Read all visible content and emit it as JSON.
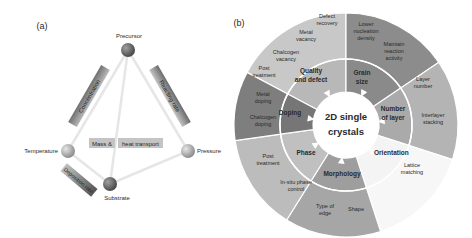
{
  "panel_a": {
    "label": "(a)",
    "nodes": {
      "precursor": "Precursor",
      "temperature": "Temperature",
      "pressure": "Pressure",
      "substrate": "Substrate"
    },
    "bars": {
      "concentration": "Concentration",
      "reacting_rate": "Reacting rate",
      "deposition_rate": "Deposition rate"
    },
    "center_labels": {
      "mass": "Mass &",
      "heat": "heat transport"
    }
  },
  "panel_b": {
    "label": "(b)",
    "center": {
      "line1": "2D single",
      "line2": "crystals"
    },
    "inner": {
      "quality": [
        "Quality",
        "and defect"
      ],
      "grain": [
        "Grain",
        "size"
      ],
      "layer": [
        "Number",
        "of layer"
      ],
      "orientation": "Orientation",
      "morphology": "Morphology",
      "phase": "Phase",
      "doping": "Doping"
    },
    "outer": {
      "defect_recovery": [
        "Defect",
        "recovery"
      ],
      "metal_vacancy": [
        "Metal",
        "vacancy"
      ],
      "chalcogen_vacancy": [
        "Chalcogen",
        "vacancy"
      ],
      "lower_nucleation": [
        "Lower",
        "nucleation",
        "density"
      ],
      "maintain_reaction": [
        "Maintain",
        "reaction",
        "activity"
      ],
      "layer_number": [
        "Layer",
        "number"
      ],
      "interlayer_stacking": [
        "Interlayer",
        "stacking"
      ],
      "lattice_matching": [
        "Lattice",
        "matching"
      ],
      "shape": "Shape",
      "type_of_edge": [
        "Type of",
        "edge"
      ],
      "insitu_phase": [
        "In-situ phase",
        "control"
      ],
      "post_treatment_phase": [
        "Post",
        "treatment"
      ],
      "chalcogen_doping": [
        "Chalcogen",
        "doping"
      ],
      "metal_doping": [
        "Metal",
        "doping"
      ],
      "post_treatment_doping": [
        "Post",
        "treatment"
      ]
    }
  }
}
